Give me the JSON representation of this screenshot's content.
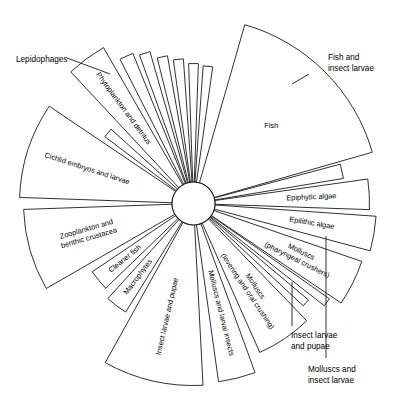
{
  "diagram": {
    "type": "radial-wedge-diagram",
    "title": "",
    "center": {
      "x": 193.5,
      "y": 203.5
    },
    "hub_radius": 21.5,
    "colors": {
      "stroke": "#1a1a1a",
      "fill": "#ffffff",
      "text": "#000000",
      "background": "#ffffff"
    },
    "wedges": [
      {
        "id": "fish",
        "label": "Fish",
        "start_angle": -74,
        "end_angle": -16,
        "radius": 186,
        "label_mode": "horizontal",
        "label_radius": 110,
        "external": false
      },
      {
        "id": "fish-and-insect-larvae",
        "label": "Fish and insect larvae",
        "start_angle": -15,
        "end_angle": -9.5,
        "radius": 152,
        "label_mode": "external",
        "label_radius": 152,
        "external": true,
        "external_label_lines": [
          "Fish and",
          "insect larvae"
        ],
        "external_x": 328,
        "external_y": 60,
        "leader": {
          "x1": 292,
          "y1": 84,
          "x2": 309,
          "y2": 74
        }
      },
      {
        "id": "epiphytic-algae",
        "label": "Epiphytic algae",
        "start_angle": -8,
        "end_angle": 2,
        "radius": 176,
        "label_mode": "radial",
        "label_radius": 118,
        "external": false
      },
      {
        "id": "epilithic-algae",
        "label": "Epilithic algae",
        "start_angle": 4,
        "end_angle": 15,
        "radius": 183,
        "label_mode": "radial",
        "label_radius": 120,
        "external": false
      },
      {
        "id": "molluscs-pharyngeal-crushers",
        "label": "Molluscs (pharyngeal crushers)",
        "start_angle": 19,
        "end_angle": 34,
        "radius": 178,
        "label_mode": "radial-two-line",
        "label_lines": [
          "Molluscs",
          "(pharyngeal crushers)"
        ],
        "label_radius": 118,
        "external": false
      },
      {
        "id": "molluscs-and-insect-larvae",
        "label": "Molluscs and insect larvae",
        "start_angle": 35,
        "end_angle": 38,
        "radius": 166,
        "label_mode": "external",
        "label_radius": 166,
        "external": true,
        "external_label_lines": [
          "Molluscs and",
          "insect larvae"
        ],
        "external_x": 308,
        "external_y": 372,
        "leader": {
          "x1": 326,
          "y1": 236,
          "x2": 326,
          "y2": 358
        }
      },
      {
        "id": "insect-larvae-and-pupae-right",
        "label": "Insect larvae and pupae",
        "start_angle": 40,
        "end_angle": 43,
        "radius": 150,
        "label_mode": "external",
        "label_radius": 150,
        "external": true,
        "external_label_lines": [
          "Insect larvae",
          "and pupae"
        ],
        "external_x": 291,
        "external_y": 338,
        "leader": {
          "x1": 292,
          "y1": 282,
          "x2": 292,
          "y2": 326
        }
      },
      {
        "id": "molluscs-levering-and-oral-crushing",
        "label": "Molluscs (levering and oral crushing)",
        "start_angle": 46,
        "end_angle": 66,
        "radius": 163,
        "label_mode": "radial-two-line",
        "label_lines": [
          "Molluscs",
          "(levering and oral crushing)"
        ],
        "label_radius": 103,
        "external": false
      },
      {
        "id": "molluscs-and-larval-insects",
        "label": "Molluscs and larval insects",
        "start_angle": 70,
        "end_angle": 82,
        "radius": 180,
        "label_mode": "radial",
        "label_radius": 113,
        "external": false
      },
      {
        "id": "insect-larvae-and-pupae-bottom",
        "label": "Insect larvae and pupae",
        "start_angle": 87,
        "end_angle": 119,
        "radius": 182,
        "label_mode": "radial",
        "label_radius": 116,
        "external": false
      },
      {
        "id": "macrophytes",
        "label": "Macrophytes",
        "start_angle": 122,
        "end_angle": 132,
        "radius": 128,
        "label_mode": "radial",
        "label_radius": 92,
        "external": false
      },
      {
        "id": "cleaner-fish",
        "label": "Cleaner fish",
        "start_angle": 136,
        "end_angle": 146,
        "radius": 122,
        "label_mode": "radial",
        "label_radius": 88,
        "external": false
      },
      {
        "id": "zooplankton-and-benthic-crustacea",
        "label": "Zooplankton and benthic crustacea",
        "start_angle": 150,
        "end_angle": 178,
        "radius": 170,
        "label_mode": "radial-two-line",
        "label_lines": [
          "Zooplankton and",
          "benthic crustacea"
        ],
        "label_radius": 110,
        "external": false
      },
      {
        "id": "cichlid-embryos-and-larvae",
        "label": "Cichlid embryos and larvae",
        "start_angle": -178,
        "end_angle": -146,
        "radius": 174,
        "label_mode": "radial",
        "label_radius": 112,
        "external": false
      },
      {
        "id": "lepidophages",
        "label": "Lepidophages",
        "start_angle": -143,
        "end_angle": -138,
        "radius": 111,
        "label_mode": "external",
        "label_radius": 111,
        "external": true,
        "external_label_lines": [
          "Lepidophages"
        ],
        "external_x": 16,
        "external_y": 62,
        "leader": {
          "x1": 110,
          "y1": 74,
          "x2": 67,
          "y2": 58
        }
      },
      {
        "id": "phytoplankton-and-detritus",
        "label": "Phytoplankton and detritus",
        "start_angle": -133,
        "end_angle": -120,
        "radius": 180,
        "label_mode": "radial",
        "label_radius": 118,
        "external": false
      },
      {
        "id": "unlabelled-thin-a",
        "label": "",
        "start_angle": -117,
        "end_angle": -112,
        "radius": 162,
        "label_mode": "none",
        "label_radius": 0,
        "external": false
      },
      {
        "id": "unlabelled-thin-b",
        "label": "",
        "start_angle": -110,
        "end_angle": -106,
        "radius": 158,
        "label_mode": "none",
        "label_radius": 0,
        "external": false
      },
      {
        "id": "unlabelled-thin-c",
        "label": "",
        "start_angle": -104,
        "end_angle": -100,
        "radius": 150,
        "label_mode": "none",
        "label_radius": 0,
        "external": false
      },
      {
        "id": "unlabelled-thin-d",
        "label": "",
        "start_angle": -98,
        "end_angle": -94,
        "radius": 145,
        "label_mode": "none",
        "label_radius": 0,
        "external": false
      },
      {
        "id": "unlabelled-thin-e",
        "label": "",
        "start_angle": -92,
        "end_angle": -88,
        "radius": 140,
        "label_mode": "none",
        "label_radius": 0,
        "external": false
      },
      {
        "id": "unlabelled-thin-f",
        "label": "",
        "start_angle": -86,
        "end_angle": -82,
        "radius": 138,
        "label_mode": "none",
        "label_radius": 0,
        "external": false
      }
    ]
  }
}
